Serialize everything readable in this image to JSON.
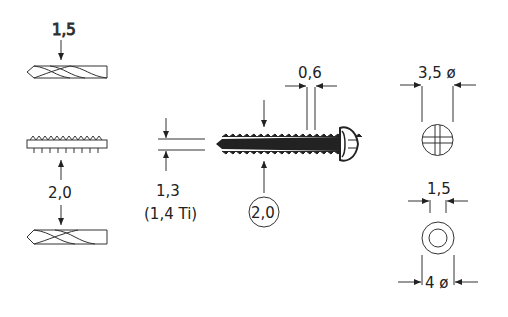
{
  "diagram": {
    "type": "technical-drawing",
    "colors": {
      "ink": "#222222",
      "background": "#ffffff"
    }
  },
  "labels": {
    "drill_top_diameter": "1,5",
    "tap_to_drill_diameter": "2,0",
    "core_diameter": "1,3",
    "core_diameter_ti": "(1,4 Ti)",
    "thread_diameter_circled": "2,0",
    "thread_pitch": "0,6",
    "head_diameter": "3,5 ø",
    "hex_socket": "1,5",
    "washer_diameter": "4 ø"
  },
  "components": [
    {
      "id": "drill-bit-1-5",
      "label_ref": "drill_top_diameter"
    },
    {
      "id": "tap",
      "label_ref": "tap_to_drill_diameter"
    },
    {
      "id": "drill-bit-2-0",
      "label_ref": "tap_to_drill_diameter"
    },
    {
      "id": "cortex-screw",
      "label_ref": "thread_diameter_circled"
    },
    {
      "id": "screw-head-cross-slot",
      "label_ref": "head_diameter"
    },
    {
      "id": "hex-socket-head",
      "label_ref": "hex_socket"
    }
  ]
}
